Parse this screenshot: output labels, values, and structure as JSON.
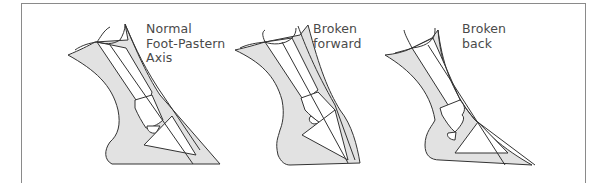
{
  "figure": {
    "panels": [
      {
        "id": "normal",
        "label_lines": [
          "Normal",
          "Foot-Pastern",
          "Axis"
        ]
      },
      {
        "id": "broken-forward",
        "label_lines": [
          "Broken",
          "forward"
        ]
      },
      {
        "id": "broken-back",
        "label_lines": [
          "Broken",
          "back"
        ]
      }
    ],
    "colors": {
      "hoof_fill": "#e2e2e2",
      "outline": "#333333",
      "frame": "#8a8a8a",
      "text": "#4a4a4a"
    }
  }
}
